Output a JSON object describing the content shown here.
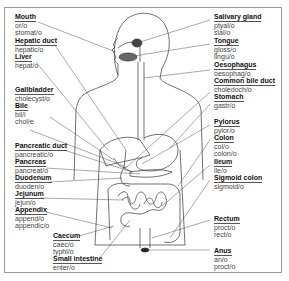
{
  "diagram": {
    "left_labels": [
      {
        "name": "Mouth",
        "roots": [
          "or/o",
          "stomat/o"
        ]
      },
      {
        "name": "Hepatic duct",
        "roots": [
          "hepatic/o"
        ]
      },
      {
        "name": "Liver",
        "roots": [
          "hepat/o"
        ]
      },
      {
        "name": "Gallbladder",
        "roots": [
          "cholecyst/o"
        ]
      },
      {
        "name": "Bile",
        "roots": [
          "bil/i",
          "chol/e"
        ]
      },
      {
        "name": "Pancreatic duct",
        "roots": [
          "pancreatic/o"
        ]
      },
      {
        "name": "Pancreas",
        "roots": [
          "pancreat/o"
        ]
      },
      {
        "name": "Duodenum",
        "roots": [
          "duoden/o"
        ]
      },
      {
        "name": "Jejunum",
        "roots": [
          "jejun/o"
        ]
      },
      {
        "name": "Appendix",
        "roots": [
          "append/o",
          "appendic/o"
        ]
      }
    ],
    "bottom_labels": [
      {
        "name": "Caecum",
        "roots": [
          "caec/o",
          "typhl/o"
        ]
      },
      {
        "name": "Small intestine",
        "roots": [
          "enter/o"
        ]
      }
    ],
    "right_labels": [
      {
        "name": "Salivary gland",
        "roots": [
          "ptyal/o",
          "sial/o"
        ]
      },
      {
        "name": "Tongue",
        "roots": [
          "gloss/o",
          "lingu/o"
        ]
      },
      {
        "name": "Oesophagus",
        "roots": [
          "oesophag/o"
        ]
      },
      {
        "name": "Common bile duct",
        "roots": [
          "choledoch/o"
        ]
      },
      {
        "name": "Stomach",
        "roots": [
          "gastr/o"
        ]
      },
      {
        "name": "Pylorus",
        "roots": [
          "pylor/o"
        ]
      },
      {
        "name": "Colon",
        "roots": [
          "col/o",
          "colon/o"
        ]
      },
      {
        "name": "Ileum",
        "roots": [
          "ile/o"
        ]
      },
      {
        "name": "Sigmoid colon",
        "roots": [
          "sigmoid/o"
        ]
      },
      {
        "name": "Rectum",
        "roots": [
          "proct/o",
          "rect/o"
        ]
      },
      {
        "name": "Anus",
        "roots": [
          "an/o",
          "proct/o"
        ]
      }
    ]
  }
}
